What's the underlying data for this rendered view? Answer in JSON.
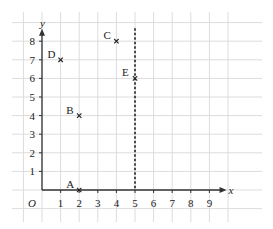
{
  "diagram": {
    "type": "coordinate-grid",
    "origin_label": "O",
    "x_axis": {
      "label": "x",
      "ticks": [
        "1",
        "2",
        "3",
        "4",
        "5",
        "6",
        "7",
        "8",
        "9"
      ]
    },
    "y_axis": {
      "label": "y",
      "ticks": [
        "1",
        "2",
        "3",
        "4",
        "5",
        "6",
        "7",
        "8"
      ]
    },
    "points": [
      {
        "name": "A",
        "x": 2,
        "y": 0
      },
      {
        "name": "B",
        "x": 2,
        "y": 4
      },
      {
        "name": "C",
        "x": 4,
        "y": 8
      },
      {
        "name": "D",
        "x": 1,
        "y": 7
      },
      {
        "name": "E",
        "x": 5,
        "y": 6
      }
    ],
    "dashed_line": {
      "equation": "x = 5"
    },
    "colors": {
      "grid": "#dcdcdc",
      "axis": "#333333",
      "text": "#222222"
    }
  }
}
